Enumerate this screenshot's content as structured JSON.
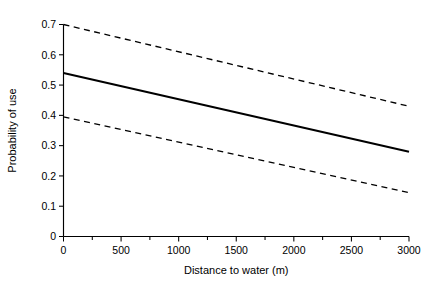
{
  "chart_data": {
    "type": "line",
    "title": "",
    "xlabel": "Distance to water (m)",
    "ylabel": "Probability of use",
    "xlim": [
      0,
      3000
    ],
    "ylim": [
      0,
      0.7
    ],
    "grid": false,
    "legend": "none",
    "xticks": [
      0,
      500,
      1000,
      1500,
      2000,
      2500,
      3000
    ],
    "xtick_labels": [
      "0",
      "500",
      "1000",
      "1500",
      "2000",
      "2500",
      "3000"
    ],
    "xminor_ticks": [
      250,
      750,
      1250,
      1750,
      2250,
      2750
    ],
    "yticks": [
      0,
      0.1,
      0.2,
      0.3,
      0.4,
      0.5,
      0.6,
      0.7
    ],
    "ytick_labels": [
      "0",
      "0.1",
      "0.2",
      "0.3",
      "0.4",
      "0.5",
      "0.6",
      "0.7"
    ],
    "x": [
      0,
      3000
    ],
    "series": [
      {
        "name": "Upper confidence limit",
        "style": "dashed",
        "color": "#000000",
        "values": [
          0.7,
          0.43
        ]
      },
      {
        "name": "Predicted probability of use",
        "style": "solid",
        "color": "#000000",
        "values": [
          0.54,
          0.28
        ]
      },
      {
        "name": "Lower confidence limit",
        "style": "dashed",
        "color": "#000000",
        "values": [
          0.395,
          0.145
        ]
      }
    ]
  },
  "figure": {
    "background": "#ffffff",
    "axis_color": "#000000"
  }
}
